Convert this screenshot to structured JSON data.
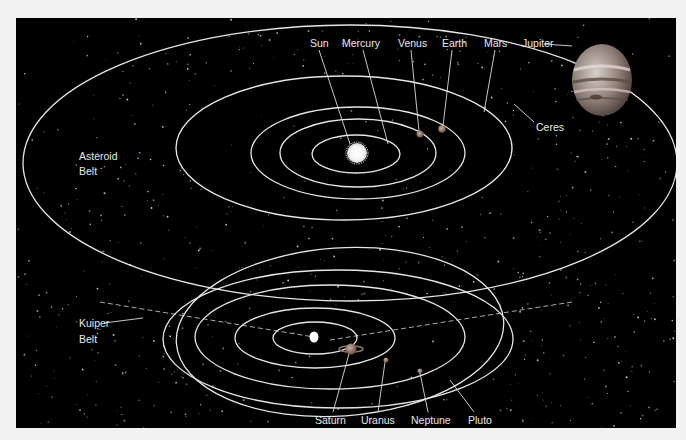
{
  "diagram": {
    "type": "solar-system-orbits",
    "colors": {
      "page_background": "#f2f2f2",
      "panel_background": "#000000",
      "orbit_line": "#e6e6e6",
      "label_text": "#e8e8e8",
      "sun": "#ffffff",
      "jupiter": "#9a8a80"
    },
    "inner_system": {
      "labels": {
        "sun": "Sun",
        "mercury": "Mercury",
        "venus": "Venus",
        "earth": "Earth",
        "mars": "Mars",
        "jupiter": "Jupiter",
        "ceres": "Ceres",
        "asteroid_belt_line1": "Asteroid",
        "asteroid_belt_line2": "Belt"
      }
    },
    "outer_system": {
      "labels": {
        "saturn": "Saturn",
        "uranus": "Uranus",
        "neptune": "Neptune",
        "pluto": "Pluto",
        "kuiper_belt_line1": "Kuiper",
        "kuiper_belt_line2": "Belt"
      }
    }
  }
}
